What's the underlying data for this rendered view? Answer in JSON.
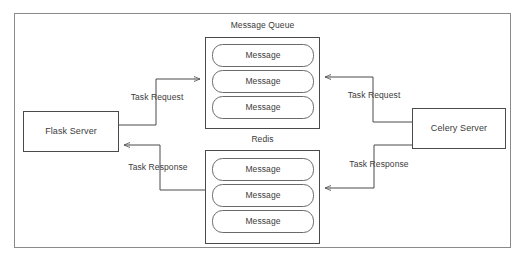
{
  "diagram": {
    "background_color": "#ffffff",
    "frame_color": "#8a8a8a",
    "stroke_color": "#4a4a4a",
    "text_color": "#3b3b3b",
    "nodes": {
      "flask_server": {
        "label": "Flask Server"
      },
      "celery_server": {
        "label": "Celery Server"
      },
      "message_queue": {
        "title": "Message Queue",
        "messages": [
          {
            "label": "Message"
          },
          {
            "label": "Message"
          },
          {
            "label": "Message"
          }
        ]
      },
      "redis": {
        "title": "Redis",
        "messages": [
          {
            "label": "Message"
          },
          {
            "label": "Message"
          },
          {
            "label": "Message"
          }
        ]
      }
    },
    "edges": {
      "flask_to_queue": {
        "label": "Task Request"
      },
      "celery_to_queue": {
        "label": "Task Request"
      },
      "redis_to_flask": {
        "label": "Task Response"
      },
      "celery_to_redis": {
        "label": "Task Response"
      }
    }
  }
}
